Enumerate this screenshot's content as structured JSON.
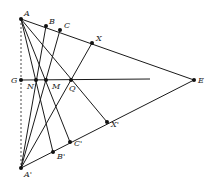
{
  "diagram": {
    "points": {
      "A": {
        "label": "A",
        "x": 21,
        "y": 19
      },
      "B": {
        "label": "B",
        "x": 46,
        "y": 26
      },
      "C": {
        "label": "C",
        "x": 60,
        "y": 30
      },
      "X": {
        "label": "X",
        "x": 92,
        "y": 43
      },
      "E": {
        "label": "E",
        "x": 194,
        "y": 80
      },
      "G": {
        "label": "G",
        "x": 21,
        "y": 80
      },
      "N": {
        "label": "N",
        "x": 36,
        "y": 80
      },
      "M": {
        "label": "M",
        "x": 46,
        "y": 80
      },
      "Q": {
        "label": "Q",
        "x": 71,
        "y": 80
      },
      "A2": {
        "label": "A'",
        "x": 21,
        "y": 168
      },
      "B2": {
        "label": "B'",
        "x": 53,
        "y": 152
      },
      "C2": {
        "label": "C'",
        "x": 70,
        "y": 142
      },
      "X2": {
        "label": "X'",
        "x": 107,
        "y": 122
      }
    }
  }
}
